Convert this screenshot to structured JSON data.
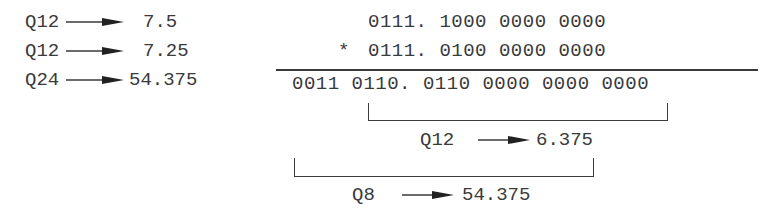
{
  "left_list": [
    {
      "format": "Q12",
      "value": "7.5"
    },
    {
      "format": "Q12",
      "value": "7.25"
    },
    {
      "format": "Q24",
      "value": "54.375"
    }
  ],
  "multiplication": {
    "operand_a": "0111. 1000 0000 0000",
    "operator": "*",
    "operand_b": "0111. 0100 0000 0000",
    "product": "0011 0110. 0110 0000 0000 0000"
  },
  "bracket_q12": {
    "format": "Q12",
    "value": "6.375"
  },
  "bracket_q8": {
    "format": "Q8",
    "value": "54.375"
  },
  "colors": {
    "ink": "#3a3a3a",
    "background": "#ffffff"
  }
}
